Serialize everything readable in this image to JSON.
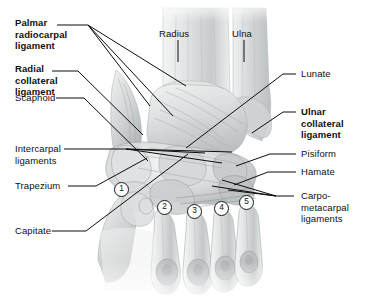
{
  "figure": {
    "style": "grayscale anatomical illustration",
    "background_color": "#ffffff",
    "ink_color": "#101010",
    "bone_tone_light": "#eceded",
    "bone_tone_mid": "#c9cccd",
    "bone_tone_dark": "#8f9395"
  },
  "labels": {
    "palmar_radiocarpal": {
      "lines": [
        "Palmar",
        "radiocarpal",
        "ligament"
      ],
      "bold": true
    },
    "radial_collateral": {
      "lines": [
        "Radial",
        "collateral",
        "ligament"
      ],
      "bold": true
    },
    "scaphoid": {
      "lines": [
        "Scaphoid"
      ],
      "bold": false
    },
    "intercarpal": {
      "lines": [
        "Intercarpal",
        "ligaments"
      ],
      "bold": false
    },
    "trapezium": {
      "lines": [
        "Trapezium"
      ],
      "bold": false
    },
    "capitate": {
      "lines": [
        "Capitate"
      ],
      "bold": false
    },
    "radius": {
      "lines": [
        "Radius"
      ],
      "bold": false
    },
    "ulna": {
      "lines": [
        "Ulna"
      ],
      "bold": false
    },
    "lunate": {
      "lines": [
        "Lunate"
      ],
      "bold": false
    },
    "ulnar_collateral": {
      "lines": [
        "Ulnar",
        "collateral",
        "ligament"
      ],
      "bold": true
    },
    "pisiform": {
      "lines": [
        "Pisiform"
      ],
      "bold": false
    },
    "hamate": {
      "lines": [
        "Hamate"
      ],
      "bold": false
    },
    "carpometacarpal": {
      "lines": [
        "Carpo-",
        "metacarpal",
        "ligaments"
      ],
      "bold": false
    }
  },
  "callouts": {
    "one": "1",
    "two": "2",
    "three": "3",
    "four": "4",
    "five": "5"
  }
}
